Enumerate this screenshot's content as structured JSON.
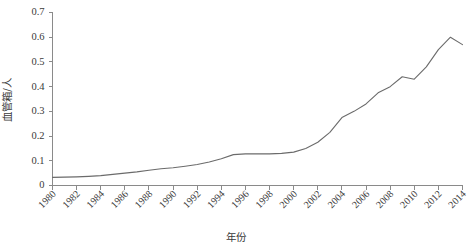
{
  "chart_data": {
    "type": "line",
    "title": "",
    "xlabel": "年份",
    "ylabel": "血管箱/人",
    "xlim": [
      1980,
      2014
    ],
    "ylim": [
      0,
      0.7
    ],
    "grid": false,
    "legend": "none",
    "x_tick_labels": [
      "1980",
      "1982",
      "1984",
      "1986",
      "1988",
      "1990",
      "1992",
      "1994",
      "1996",
      "1998",
      "2000",
      "2002",
      "2004",
      "2006",
      "2008",
      "2010",
      "2012",
      "2014"
    ],
    "y_tick_labels": [
      "0",
      "0.1",
      "0.2",
      "0.3",
      "0.4",
      "0.5",
      "0.6",
      "0.7"
    ],
    "y_tick_values": [
      0,
      0.1,
      0.2,
      0.3,
      0.4,
      0.5,
      0.6,
      0.7
    ],
    "x": [
      1980,
      1981,
      1982,
      1983,
      1984,
      1985,
      1986,
      1987,
      1988,
      1989,
      1990,
      1991,
      1992,
      1993,
      1994,
      1995,
      1996,
      1997,
      1998,
      1999,
      2000,
      2001,
      2002,
      2003,
      2004,
      2005,
      2006,
      2007,
      2008,
      2009,
      2010,
      2011,
      2012,
      2013,
      2014
    ],
    "values": [
      0.033,
      0.034,
      0.035,
      0.037,
      0.04,
      0.045,
      0.05,
      0.055,
      0.062,
      0.068,
      0.072,
      0.078,
      0.085,
      0.095,
      0.108,
      0.125,
      0.128,
      0.128,
      0.128,
      0.13,
      0.135,
      0.15,
      0.175,
      0.215,
      0.275,
      0.3,
      0.33,
      0.375,
      0.4,
      0.44,
      0.43,
      0.48,
      0.55,
      0.6,
      0.57
    ],
    "series_name": "血管箱/人",
    "line_color": "#6b6b6b",
    "axis_color": "#8a8a8a"
  }
}
